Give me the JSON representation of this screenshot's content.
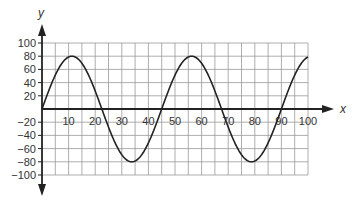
{
  "chart_data": {
    "type": "line",
    "title": "",
    "xlabel": "x",
    "ylabel": "y",
    "xlim": [
      0,
      100
    ],
    "ylim": [
      -100,
      100
    ],
    "grid": true,
    "x_grid_step": 5,
    "y_grid_step": 20,
    "x_ticks": [
      10,
      20,
      30,
      40,
      50,
      60,
      70,
      80,
      90,
      100
    ],
    "y_ticks": [
      100,
      80,
      60,
      40,
      20,
      -20,
      -40,
      -60,
      -80,
      -100
    ],
    "series": [
      {
        "name": "y = 80 sin(2πx/45)",
        "function": "sine",
        "amplitude": 80,
        "period": 45,
        "phase": 0,
        "x": [
          0,
          11.25,
          22.5,
          33.75,
          45,
          56.25,
          67.5,
          78.75,
          90,
          100
        ],
        "values": [
          0,
          80,
          0,
          -80,
          0,
          80,
          0,
          -80,
          0,
          79
        ]
      }
    ]
  },
  "labels": {
    "x_axis": "x",
    "y_axis": "y"
  }
}
